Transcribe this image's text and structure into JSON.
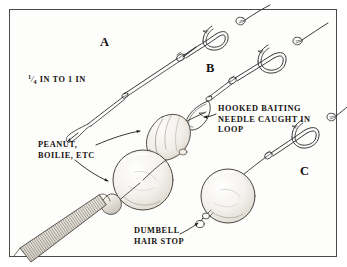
{
  "figure": {
    "background_color": "#ffffff",
    "panel_color": "#fdfdfc",
    "border_color": "#4a4a4a",
    "ink_color": "#15120f",
    "line_color": "#3a3a3a"
  },
  "labels": {
    "letter_a": "A",
    "letter_b": "B",
    "letter_c": "C",
    "size_numerator": "1",
    "size_denominator": "4",
    "size_rest": "IN TO 1 IN",
    "size_full": "¼ IN TO 1 IN",
    "needle_line1": "HOOKED BAITING",
    "needle_line2": "NEEDLE CAUGHT IN",
    "needle_line3": "LOOP",
    "bait_line1": "PEANUT,",
    "bait_line2": "BOILIE, ETC",
    "stop_line1": "DUMBELL",
    "stop_line2": "HAIR STOP"
  },
  "icons": {
    "hook_a": "fish-hook-icon",
    "hook_b": "fish-hook-icon",
    "hook_c": "fish-hook-icon",
    "hair_loop": "hair-loop-icon",
    "baiting_needle": "baiting-needle-icon",
    "needle_handle": "ribbed-handle-icon",
    "peanut": "peanut-bait-icon",
    "boilie_left": "boilie-sphere-icon",
    "boilie_right": "boilie-sphere-icon",
    "hair_stop": "dumbell-hair-stop-icon",
    "arrow_bait_upper": "arrow-pointer-icon",
    "arrow_bait_lower": "arrow-pointer-icon",
    "arrow_needle": "arrow-pointer-icon",
    "arrow_stop": "arrow-pointer-icon",
    "arrow_hair_tip": "arrow-pointer-icon"
  }
}
